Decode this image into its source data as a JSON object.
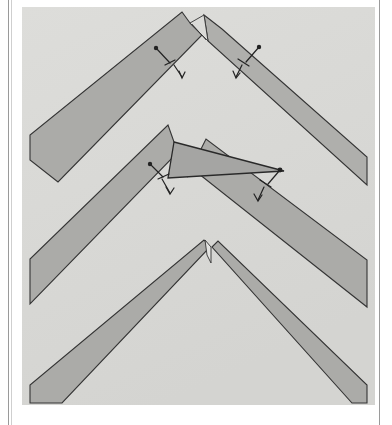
{
  "page": {
    "background_color": "#ffffff",
    "frame": {
      "left_rule_color": "#9a9a9a",
      "right_rule_color": "#9a9a9a",
      "inner_rule_color": "#cfcfcf"
    }
  },
  "photo": {
    "name": "chevron-joint-photograph",
    "background_color": "#d9d9d6",
    "band_face_color": "#a9a9a6",
    "band_edge_color": "#9a9a96",
    "outline_color": "#2b2b2b",
    "gusset_color": "#a3a3a0",
    "x": 22,
    "y": 7,
    "width": 353,
    "height": 398,
    "description": "Three nested V-shaped (chevron) gray bands seen in perspective, with small dot-and-arrow dimension annotations and a flat triangular gusset plate at the middle apex."
  },
  "shapes": {
    "chevrons": [
      {
        "name": "top-chevron",
        "label": "Top chevron band",
        "apex_x": 196,
        "apex_y": 12,
        "has_split_apex": true,
        "split_style": "overlapping-butt-joint"
      },
      {
        "name": "middle-chevron",
        "label": "Middle chevron band",
        "apex_x": 174,
        "apex_y": 142,
        "has_split_apex": true,
        "split_style": "open-mitre-with-gusset"
      },
      {
        "name": "bottom-chevron",
        "label": "Bottom chevron band",
        "apex_x": 204,
        "apex_y": 240,
        "has_split_apex": true,
        "split_style": "narrow-kerf-slit"
      }
    ],
    "gusset": {
      "name": "triangular-gusset-plate",
      "label": "Triangular gusset plate",
      "vertices": [
        [
          174,
          142
        ],
        [
          283,
          171
        ],
        [
          168,
          177
        ]
      ],
      "fill": "#a3a3a0"
    }
  },
  "annotations": [
    {
      "name": "annotation-top-left",
      "label": "dimension mark",
      "dot_x": 156,
      "dot_y": 48,
      "arrow_to_x": 176,
      "arrow_to_y": 70
    },
    {
      "name": "annotation-top-right",
      "label": "dimension mark",
      "dot_x": 259,
      "dot_y": 47,
      "arrow_to_x": 240,
      "arrow_to_y": 70
    },
    {
      "name": "annotation-mid-left",
      "label": "dimension mark",
      "dot_x": 150,
      "dot_y": 164,
      "arrow_to_x": 168,
      "arrow_to_y": 186
    },
    {
      "name": "annotation-mid-right",
      "label": "dimension mark",
      "dot_x": 281,
      "dot_y": 170,
      "arrow_to_x": 266,
      "arrow_to_y": 190
    }
  ],
  "colors": {
    "paper": "#ffffff",
    "photo_background": "#d9d9d6",
    "band_light": "#d2d2cf",
    "band_mid": "#a9a9a6",
    "band_dark": "#9c9c99",
    "ink": "#2b2b2b",
    "rule": "#9a9a9a"
  }
}
